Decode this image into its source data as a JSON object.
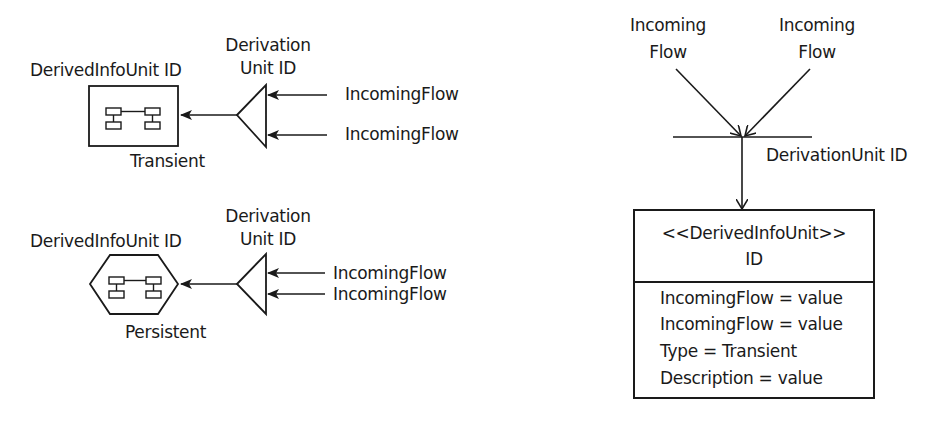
{
  "transient_example": {
    "unit_label": "DerivedInfoUnit ID",
    "derivation_label_line1": "Derivation",
    "derivation_label_line2": "Unit ID",
    "incoming_flows": [
      "IncomingFlow",
      "IncomingFlow"
    ],
    "type_label": "Transient",
    "shape": "rectangle",
    "icon": "component-structure-icon"
  },
  "persistent_example": {
    "unit_label": "DerivedInfoUnit ID",
    "derivation_label_line1": "Derivation",
    "derivation_label_line2": "Unit ID",
    "incoming_flows": [
      "IncomingFlow",
      "IncomingFlow"
    ],
    "type_label": "Persistent",
    "shape": "hexagon",
    "icon": "component-structure-icon"
  },
  "uml_example": {
    "incoming_flows": [
      {
        "line1": "Incoming",
        "line2": "Flow"
      },
      {
        "line1": "Incoming",
        "line2": "Flow"
      }
    ],
    "derivation_unit_label": "DerivationUnit ID",
    "class_box": {
      "stereotype": "<<DerivedInfoUnit>>",
      "name": "ID",
      "attributes": [
        "IncomingFlow = value",
        "IncomingFlow = value",
        "Type = Transient",
        "Description = value"
      ]
    }
  },
  "colors": {
    "stroke": "#1a1a1a",
    "background": "#ffffff"
  }
}
